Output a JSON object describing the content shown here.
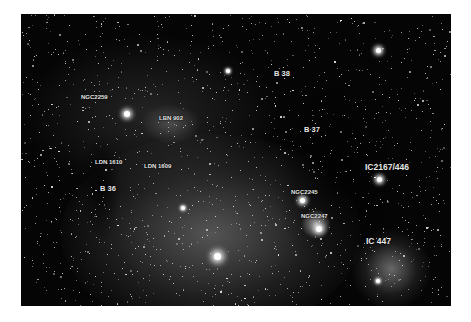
{
  "image": {
    "description": "Astrophotograph of Monoceros star field with dark and bright nebulae",
    "background": "#050505",
    "frame_background": "#ffffff"
  },
  "labels": [
    {
      "id": "ngc2259",
      "text": "NGC2259",
      "x": 60,
      "y": 80,
      "size": "sm"
    },
    {
      "id": "lbn902",
      "text": "LBN 902",
      "x": 138,
      "y": 101,
      "size": "sm"
    },
    {
      "id": "b38",
      "text": "B 38",
      "x": 253,
      "y": 56,
      "size": "md"
    },
    {
      "id": "b37",
      "text": "B 37",
      "x": 283,
      "y": 112,
      "size": "md"
    },
    {
      "id": "ldn1610",
      "text": "LDN 1610",
      "x": 74,
      "y": 145,
      "size": "sm"
    },
    {
      "id": "ldn1609",
      "text": "LDN 1609",
      "x": 123,
      "y": 149,
      "size": "sm"
    },
    {
      "id": "b36",
      "text": "B 36",
      "x": 79,
      "y": 171,
      "size": "md"
    },
    {
      "id": "ic2167",
      "text": "IC2167/446",
      "x": 344,
      "y": 149,
      "size": "lg"
    },
    {
      "id": "ngc2245",
      "text": "NGC2245",
      "x": 270,
      "y": 175,
      "size": "sm"
    },
    {
      "id": "ngc2247",
      "text": "NGC2247",
      "x": 280,
      "y": 199,
      "size": "sm"
    },
    {
      "id": "ic447",
      "text": "IC 447",
      "x": 345,
      "y": 223,
      "size": "lg"
    }
  ]
}
